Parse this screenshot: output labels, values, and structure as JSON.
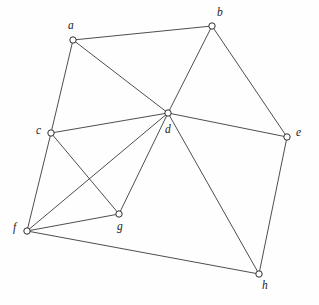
{
  "figure": {
    "width": 319,
    "height": 305,
    "background_color": "#fefefe",
    "edge_color": "#3a3a3a",
    "vertex_fill_color": "#ffffff",
    "vertex_stroke_color": "#2e2e2e",
    "label_color": "#1a1a1a"
  },
  "chart_data": {
    "type": "diagram",
    "diagram_type": "undirected-graph",
    "title": "",
    "xlabel": "",
    "ylabel": "",
    "vertex_count": 8,
    "edge_count": 15,
    "nodes": [
      {
        "id": "a",
        "label": "a",
        "x": 73,
        "y": 40,
        "label_x": 68,
        "label_y": 20,
        "degree": 3
      },
      {
        "id": "b",
        "label": "b",
        "x": 212,
        "y": 26,
        "label_x": 217,
        "label_y": 7,
        "degree": 3
      },
      {
        "id": "c",
        "label": "c",
        "x": 51,
        "y": 133,
        "label_x": 36,
        "label_y": 125,
        "degree": 4
      },
      {
        "id": "d",
        "label": "d",
        "x": 168,
        "y": 113,
        "label_x": 165,
        "label_y": 124,
        "degree": 7
      },
      {
        "id": "e",
        "label": "e",
        "x": 287,
        "y": 137,
        "label_x": 296,
        "label_y": 127,
        "degree": 3
      },
      {
        "id": "f",
        "label": "f",
        "x": 27,
        "y": 231,
        "label_x": 13,
        "label_y": 222,
        "degree": 5
      },
      {
        "id": "g",
        "label": "g",
        "x": 119,
        "y": 214,
        "label_x": 117,
        "label_y": 221,
        "degree": 3
      },
      {
        "id": "h",
        "label": "h",
        "x": 259,
        "y": 274,
        "label_x": 262,
        "label_y": 280,
        "degree": 3
      }
    ],
    "edges": [
      {
        "source": "a",
        "target": "b"
      },
      {
        "source": "a",
        "target": "c"
      },
      {
        "source": "a",
        "target": "d"
      },
      {
        "source": "b",
        "target": "d"
      },
      {
        "source": "b",
        "target": "e"
      },
      {
        "source": "c",
        "target": "d"
      },
      {
        "source": "c",
        "target": "f"
      },
      {
        "source": "c",
        "target": "g"
      },
      {
        "source": "d",
        "target": "e"
      },
      {
        "source": "d",
        "target": "f"
      },
      {
        "source": "d",
        "target": "g"
      },
      {
        "source": "d",
        "target": "h"
      },
      {
        "source": "e",
        "target": "h"
      },
      {
        "source": "f",
        "target": "g"
      },
      {
        "source": "f",
        "target": "h"
      }
    ],
    "node_radius": 3.2
  }
}
